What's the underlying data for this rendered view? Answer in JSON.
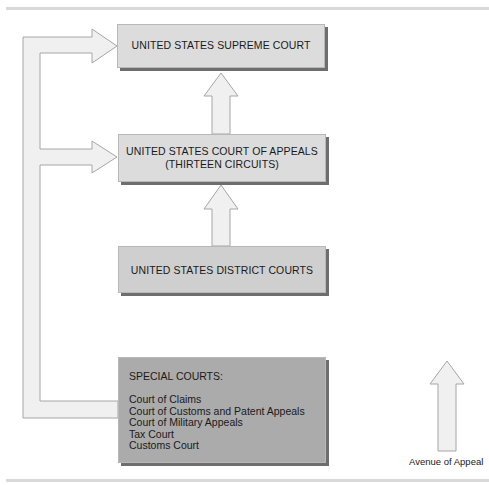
{
  "diagram": {
    "type": "hierarchy",
    "boxes": {
      "supreme": {
        "title": "UNITED STATES SUPREME COURT"
      },
      "appeals": {
        "line1": "UNITED STATES COURT OF APPEALS",
        "line2": "(THIRTEEN CIRCUITS)"
      },
      "district": {
        "title": "UNITED STATES DISTRICT COURTS"
      },
      "special": {
        "title": "SPECIAL COURTS:",
        "items": [
          "Court of Claims",
          "Court of Customs and Patent Appeals",
          "Court of Military Appeals",
          "Tax Court",
          "Customs Court"
        ]
      }
    },
    "edges": [
      {
        "from": "district",
        "to": "appeals",
        "kind": "appeal"
      },
      {
        "from": "appeals",
        "to": "supreme",
        "kind": "appeal"
      },
      {
        "from": "special",
        "to": "appeals",
        "kind": "appeal"
      },
      {
        "from": "special",
        "to": "supreme",
        "kind": "appeal"
      }
    ],
    "legend": {
      "label": "Avenue of Appeal",
      "icon": "up-arrow-icon"
    },
    "colors": {
      "arrow_fill": "#f0f0f0",
      "arrow_stroke": "#a6a6a6",
      "box_light": "#dcdcdc",
      "box_dark": "#ababab",
      "shadow": "#6e6e6e",
      "rule": "#d9d9d9"
    }
  }
}
